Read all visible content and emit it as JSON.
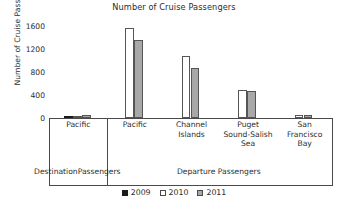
{
  "chart_data": {
    "type": "bar",
    "title": "Number of Cruise Passengers",
    "xlabel": "",
    "ylabel": "Number of Cruise Passengers",
    "ylim": [
      0,
      1600
    ],
    "yticks": [
      0,
      400,
      800,
      1200,
      1600
    ],
    "ytick_labels": [
      "0",
      "400",
      "800",
      "1200",
      "1600"
    ],
    "grid": false,
    "legend_position": "bottom",
    "categories": [
      "Pacific",
      "Pacific",
      "Channel Islands",
      "Puget Sound-Salish Sea",
      "San Francisco Bay"
    ],
    "category_lines": [
      [
        "Pacific"
      ],
      [
        "Pacific"
      ],
      [
        "Channel",
        "Islands"
      ],
      [
        "Puget",
        "Sound-Salish",
        "Sea"
      ],
      [
        "San",
        "Francisco",
        "Bay"
      ]
    ],
    "groups": [
      {
        "label": "Destination Passengers",
        "lines": [
          "Destination",
          "Passengers"
        ],
        "span": 1
      },
      {
        "label": "Departure Passengers",
        "lines": [
          "Departure Passengers"
        ],
        "span": 4
      }
    ],
    "series": [
      {
        "name": "2009",
        "color": "#1a1a1a",
        "values": [
          40,
          0,
          0,
          0,
          0
        ]
      },
      {
        "name": "2010",
        "color": "#ffffff",
        "values": [
          40,
          1560,
          1070,
          480,
          60
        ]
      },
      {
        "name": "2011",
        "color": "#a8a8a8",
        "values": [
          45,
          1350,
          870,
          470,
          60
        ]
      }
    ]
  },
  "legend": {
    "items": [
      {
        "label": "2009",
        "key": "y2009"
      },
      {
        "label": "2010",
        "key": "y2010"
      },
      {
        "label": "2011",
        "key": "y2011"
      }
    ]
  }
}
